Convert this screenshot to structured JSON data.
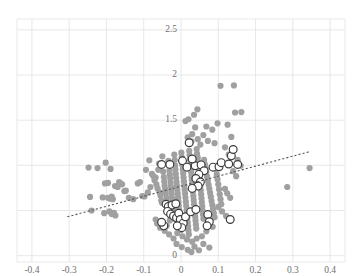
{
  "chart_data": {
    "type": "scatter",
    "title": "",
    "xlabel": "",
    "ylabel": "",
    "xlim": [
      -0.44,
      0.44
    ],
    "ylim": [
      -0.07,
      2.62
    ],
    "grid": true,
    "grid_color": "#e2e2e2",
    "legend": "none",
    "x_ticks": [
      -0.4,
      -0.3,
      -0.2,
      -0.1,
      0,
      0.1,
      0.2,
      0.3,
      0.4
    ],
    "x_tick_labels": [
      "-0.4",
      "-0.3",
      "-0.2",
      "-0.1",
      "0",
      "0.1",
      "0.2",
      "0.3",
      "0.4"
    ],
    "y_ticks": [
      0,
      0.5,
      1,
      1.5,
      2,
      2.5
    ],
    "y_tick_labels": [
      "0",
      "0.5",
      "1",
      "1.5",
      "2",
      "2.5"
    ],
    "y_tick_labels_visible": [
      "2.5",
      "2",
      "1.5",
      "0"
    ],
    "marker_colors": {
      "filled": "#a0a0a0",
      "open_stroke": "#3b3b3b",
      "open_fill": "#ffffff",
      "trend_line": "#555555"
    },
    "marker_radius_filled": 3.1,
    "marker_radius_open": 3.9,
    "series": [
      {
        "name": "background-points",
        "style": "filled-gray-circle",
        "points": [
          [
            -0.248,
            0.975
          ],
          [
            -0.224,
            0.97
          ],
          [
            -0.202,
            1.03
          ],
          [
            -0.189,
            0.96
          ],
          [
            -0.244,
            0.65
          ],
          [
            -0.21,
            0.645
          ],
          [
            -0.196,
            0.64
          ],
          [
            -0.19,
            0.63
          ],
          [
            -0.186,
            0.655
          ],
          [
            -0.183,
            0.625
          ],
          [
            -0.204,
            0.8
          ],
          [
            -0.196,
            0.805
          ],
          [
            -0.177,
            0.77
          ],
          [
            -0.17,
            0.76
          ],
          [
            -0.166,
            0.815
          ],
          [
            -0.162,
            0.8
          ],
          [
            -0.158,
            0.79
          ],
          [
            -0.152,
            0.715
          ],
          [
            -0.148,
            0.72
          ],
          [
            -0.116,
            0.8
          ],
          [
            -0.11,
            0.815
          ],
          [
            -0.104,
            0.66
          ],
          [
            -0.098,
            0.655
          ],
          [
            -0.094,
            0.95
          ],
          [
            -0.089,
            0.7
          ],
          [
            -0.085,
            1.055
          ],
          [
            -0.082,
            0.76
          ],
          [
            -0.078,
            0.905
          ],
          [
            -0.074,
            0.88
          ],
          [
            -0.071,
            0.835
          ],
          [
            -0.068,
            0.865
          ],
          [
            -0.066,
            0.79
          ],
          [
            -0.063,
            0.745
          ],
          [
            -0.061,
            0.95
          ],
          [
            -0.059,
            1.02
          ],
          [
            -0.057,
            0.7
          ],
          [
            -0.055,
            0.665
          ],
          [
            -0.053,
            0.61
          ],
          [
            -0.051,
            0.585
          ],
          [
            -0.05,
            1.1
          ],
          [
            -0.048,
            0.93
          ],
          [
            -0.046,
            0.87
          ],
          [
            -0.045,
            0.82
          ],
          [
            -0.044,
            0.775
          ],
          [
            -0.042,
            0.735
          ],
          [
            -0.041,
            0.69
          ],
          [
            -0.039,
            0.64
          ],
          [
            -0.038,
            0.6
          ],
          [
            -0.036,
            0.56
          ],
          [
            -0.035,
            0.52
          ],
          [
            -0.034,
            1.05
          ],
          [
            -0.032,
            0.99
          ],
          [
            -0.031,
            0.94
          ],
          [
            -0.03,
            0.9
          ],
          [
            -0.029,
            0.855
          ],
          [
            -0.028,
            0.81
          ],
          [
            -0.027,
            0.765
          ],
          [
            -0.026,
            0.72
          ],
          [
            -0.025,
            0.68
          ],
          [
            -0.024,
            0.635
          ],
          [
            -0.023,
            0.59
          ],
          [
            -0.022,
            0.545
          ],
          [
            -0.021,
            0.5
          ],
          [
            -0.02,
            0.455
          ],
          [
            -0.019,
            0.41
          ],
          [
            -0.018,
            1.12
          ],
          [
            -0.017,
            1.06
          ],
          [
            -0.016,
            1.0
          ],
          [
            -0.015,
            0.955
          ],
          [
            -0.014,
            0.905
          ],
          [
            -0.013,
            0.86
          ],
          [
            -0.012,
            0.815
          ],
          [
            -0.011,
            0.775
          ],
          [
            -0.01,
            0.73
          ],
          [
            -0.009,
            0.69
          ],
          [
            -0.008,
            0.645
          ],
          [
            -0.007,
            0.6
          ],
          [
            -0.006,
            0.555
          ],
          [
            -0.005,
            0.51
          ],
          [
            -0.004,
            0.465
          ],
          [
            -0.003,
            0.42
          ],
          [
            -0.002,
            0.375
          ],
          [
            -0.001,
            0.33
          ],
          [
            0.0,
            0.285
          ],
          [
            0.001,
            1.14
          ],
          [
            0.002,
            1.09
          ],
          [
            0.003,
            1.045
          ],
          [
            0.004,
            1.0
          ],
          [
            0.005,
            0.955
          ],
          [
            0.006,
            0.91
          ],
          [
            0.007,
            0.865
          ],
          [
            0.008,
            0.82
          ],
          [
            0.009,
            0.775
          ],
          [
            0.01,
            0.73
          ],
          [
            0.011,
            0.685
          ],
          [
            0.012,
            0.64
          ],
          [
            0.013,
            0.595
          ],
          [
            0.014,
            0.55
          ],
          [
            0.015,
            0.505
          ],
          [
            0.016,
            0.46
          ],
          [
            0.017,
            0.415
          ],
          [
            0.018,
            0.37
          ],
          [
            0.019,
            0.325
          ],
          [
            0.02,
            0.28
          ],
          [
            0.021,
            0.235
          ],
          [
            0.022,
            1.16
          ],
          [
            0.023,
            1.11
          ],
          [
            0.024,
            1.065
          ],
          [
            0.025,
            1.02
          ],
          [
            0.026,
            0.975
          ],
          [
            0.027,
            0.93
          ],
          [
            0.028,
            0.885
          ],
          [
            0.029,
            0.84
          ],
          [
            0.03,
            0.795
          ],
          [
            0.031,
            0.75
          ],
          [
            0.032,
            0.705
          ],
          [
            0.033,
            0.66
          ],
          [
            0.034,
            0.615
          ],
          [
            0.035,
            0.57
          ],
          [
            0.036,
            0.525
          ],
          [
            0.037,
            0.48
          ],
          [
            0.038,
            0.435
          ],
          [
            0.039,
            0.39
          ],
          [
            0.04,
            0.345
          ],
          [
            0.041,
            0.3
          ],
          [
            0.042,
            1.18
          ],
          [
            0.043,
            1.13
          ],
          [
            0.045,
            1.085
          ],
          [
            0.046,
            1.04
          ],
          [
            0.047,
            0.995
          ],
          [
            0.048,
            0.95
          ],
          [
            0.049,
            0.905
          ],
          [
            0.05,
            0.86
          ],
          [
            0.051,
            0.815
          ],
          [
            0.052,
            0.77
          ],
          [
            0.053,
            0.725
          ],
          [
            0.054,
            0.68
          ],
          [
            0.055,
            0.635
          ],
          [
            0.056,
            0.59
          ],
          [
            0.057,
            0.545
          ],
          [
            0.058,
            0.5
          ],
          [
            0.059,
            0.455
          ],
          [
            0.06,
            0.41
          ],
          [
            0.062,
            1.06
          ],
          [
            0.064,
            1.01
          ],
          [
            0.066,
            0.965
          ],
          [
            0.068,
            0.92
          ],
          [
            0.07,
            0.875
          ],
          [
            0.072,
            0.83
          ],
          [
            0.074,
            0.785
          ],
          [
            0.076,
            0.74
          ],
          [
            0.078,
            0.695
          ],
          [
            0.08,
            0.65
          ],
          [
            0.082,
            0.605
          ],
          [
            0.084,
            0.56
          ],
          [
            0.086,
            0.515
          ],
          [
            0.088,
            0.47
          ],
          [
            0.09,
            0.425
          ],
          [
            0.094,
            0.96
          ],
          [
            0.096,
            0.9
          ],
          [
            0.098,
            0.845
          ],
          [
            0.1,
            0.79
          ],
          [
            0.102,
            0.735
          ],
          [
            0.104,
            0.68
          ],
          [
            0.106,
            0.625
          ],
          [
            0.108,
            0.57
          ],
          [
            0.045,
            1.29
          ],
          [
            0.052,
            1.23
          ],
          [
            0.03,
            1.345
          ],
          [
            0.038,
            1.42
          ],
          [
            0.028,
            1.265
          ],
          [
            0.018,
            1.31
          ],
          [
            0.06,
            1.335
          ],
          [
            0.072,
            1.27
          ],
          [
            0.068,
            1.43
          ],
          [
            0.084,
            1.395
          ],
          [
            0.09,
            1.245
          ],
          [
            0.098,
            1.465
          ],
          [
            0.02,
            1.51
          ],
          [
            0.012,
            1.49
          ],
          [
            0.035,
            1.56
          ],
          [
            0.044,
            1.62
          ],
          [
            0.106,
            1.88
          ],
          [
            0.142,
            1.885
          ],
          [
            0.145,
            1.585
          ],
          [
            0.162,
            1.59
          ],
          [
            0.125,
            1.45
          ],
          [
            0.135,
            1.315
          ],
          [
            0.118,
            1.2
          ],
          [
            0.128,
            1.12
          ],
          [
            0.152,
            1.06
          ],
          [
            0.16,
            0.995
          ],
          [
            0.14,
            0.935
          ],
          [
            0.148,
            0.88
          ],
          [
            0.118,
            0.74
          ],
          [
            0.124,
            0.69
          ],
          [
            0.132,
            0.64
          ],
          [
            0.1,
            0.54
          ],
          [
            0.11,
            0.49
          ],
          [
            0.121,
            0.44
          ],
          [
            0.085,
            0.32
          ],
          [
            0.068,
            0.27
          ],
          [
            0.056,
            0.215
          ],
          [
            0.042,
            0.19
          ],
          [
            0.03,
            0.155
          ],
          [
            0.016,
            0.18
          ],
          [
            0.004,
            0.215
          ],
          [
            -0.01,
            0.25
          ],
          [
            -0.02,
            0.19
          ],
          [
            -0.032,
            0.235
          ],
          [
            0.06,
            0.13
          ],
          [
            0.076,
            0.09
          ],
          [
            0.285,
            0.76
          ],
          [
            0.345,
            0.97
          ],
          [
            -0.24,
            0.5
          ],
          [
            -0.206,
            0.47
          ],
          [
            -0.192,
            0.49
          ],
          [
            -0.186,
            0.46
          ],
          [
            -0.18,
            0.475
          ],
          [
            -0.176,
            0.445
          ],
          [
            -0.14,
            0.64
          ],
          [
            -0.128,
            0.625
          ],
          [
            -0.068,
            0.4
          ],
          [
            -0.064,
            0.355
          ],
          [
            -0.056,
            0.31
          ],
          [
            -0.044,
            0.275
          ],
          [
            -0.038,
            0.33
          ],
          [
            -0.03,
            0.39
          ],
          [
            -0.012,
            0.13
          ],
          [
            0.002,
            0.095
          ],
          [
            0.018,
            0.065
          ],
          [
            0.028,
            0.04
          ],
          [
            0.048,
            0.06
          ],
          [
            0.036,
            0.1
          ]
        ]
      },
      {
        "name": "highlighted-points",
        "style": "open-black-circle",
        "points": [
          [
            0.022,
            1.25
          ],
          [
            -0.052,
            1.01
          ],
          [
            -0.03,
            1.01
          ],
          [
            0.004,
            1.05
          ],
          [
            0.016,
            0.98
          ],
          [
            0.038,
            0.995
          ],
          [
            0.054,
            1.005
          ],
          [
            0.03,
            1.07
          ],
          [
            0.062,
            0.94
          ],
          [
            0.048,
            0.9
          ],
          [
            0.04,
            0.855
          ],
          [
            0.052,
            0.815
          ],
          [
            0.046,
            0.77
          ],
          [
            0.03,
            0.745
          ],
          [
            0.086,
            0.98
          ],
          [
            0.102,
            0.985
          ],
          [
            0.108,
            1.03
          ],
          [
            0.128,
            1.015
          ],
          [
            0.135,
            1.105
          ],
          [
            0.152,
            1.01
          ],
          [
            0.14,
            1.175
          ],
          [
            -0.04,
            0.57
          ],
          [
            -0.034,
            0.545
          ],
          [
            -0.024,
            0.56
          ],
          [
            -0.014,
            0.575
          ],
          [
            -0.036,
            0.49
          ],
          [
            -0.028,
            0.46
          ],
          [
            -0.02,
            0.44
          ],
          [
            -0.012,
            0.42
          ],
          [
            -0.006,
            0.47
          ],
          [
            -0.002,
            0.4
          ],
          [
            0.006,
            0.36
          ],
          [
            0.012,
            0.43
          ],
          [
            0.002,
            0.31
          ],
          [
            -0.01,
            0.33
          ],
          [
            -0.046,
            0.33
          ],
          [
            -0.052,
            0.37
          ],
          [
            0.026,
            0.485
          ],
          [
            0.04,
            0.51
          ],
          [
            0.072,
            0.455
          ],
          [
            0.076,
            0.375
          ],
          [
            0.132,
            0.4
          ],
          [
            0.07,
            0.33
          ]
        ]
      }
    ],
    "trend_line": {
      "name": "fitted-regression-line",
      "style": "dotted",
      "x_start": -0.305,
      "y_start": 0.43,
      "x_end": 0.348,
      "y_end": 1.155
    }
  }
}
